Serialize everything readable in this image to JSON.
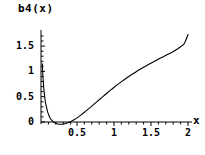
{
  "chart_data": {
    "type": "line",
    "title": "b4(x)",
    "xlabel": "x",
    "ylabel": "",
    "xlim": [
      0,
      2.05
    ],
    "ylim": [
      -0.08,
      1.78
    ],
    "grid": false,
    "legend": null,
    "x_ticks": [
      "0.5",
      "1",
      "1.5",
      "2"
    ],
    "x_tick_values": [
      0.5,
      1,
      1.5,
      2
    ],
    "y_ticks": [
      "0",
      "0.5",
      "1",
      "1.5"
    ],
    "y_tick_values": [
      0,
      0.5,
      1,
      1.5
    ],
    "series": [
      {
        "name": "b4(x)",
        "color": "#000000",
        "x": [
          0.018,
          0.025,
          0.032,
          0.04,
          0.05,
          0.062,
          0.075,
          0.09,
          0.105,
          0.125,
          0.145,
          0.165,
          0.185,
          0.205,
          0.23,
          0.255,
          0.28,
          0.31,
          0.34,
          0.375,
          0.41,
          0.45,
          0.5,
          0.55,
          0.6,
          0.65,
          0.7,
          0.75,
          0.8,
          0.85,
          0.9,
          0.95,
          1.0,
          1.05,
          1.1,
          1.15,
          1.2,
          1.25,
          1.3,
          1.35,
          1.4,
          1.45,
          1.5,
          1.55,
          1.6,
          1.65,
          1.7,
          1.75,
          1.8,
          1.85,
          1.9,
          1.95,
          2.0
        ],
        "y": [
          1.15,
          0.93,
          0.78,
          0.64,
          0.5,
          0.38,
          0.29,
          0.2,
          0.14,
          0.075,
          0.035,
          0.008,
          -0.012,
          -0.028,
          -0.04,
          -0.045,
          -0.044,
          -0.038,
          -0.028,
          -0.01,
          0.012,
          0.044,
          0.092,
          0.146,
          0.204,
          0.264,
          0.325,
          0.388,
          0.45,
          0.512,
          0.574,
          0.634,
          0.692,
          0.748,
          0.802,
          0.854,
          0.904,
          0.952,
          0.998,
          1.042,
          1.085,
          1.126,
          1.166,
          1.205,
          1.243,
          1.28,
          1.317,
          1.355,
          1.394,
          1.437,
          1.487,
          1.551,
          1.73
        ]
      }
    ]
  },
  "axes": {
    "x_axis_name": "x-axis",
    "y_axis_name": "y-axis"
  }
}
